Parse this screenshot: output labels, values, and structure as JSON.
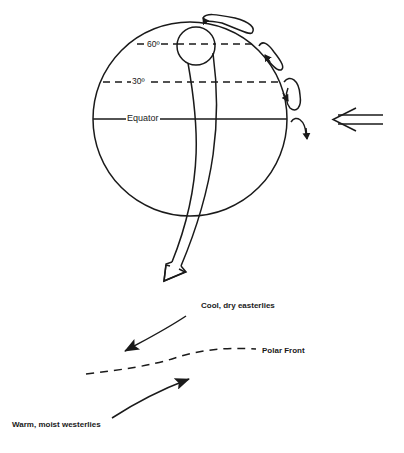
{
  "figure": {
    "globe": {
      "latitude_lines": [
        {
          "label": "60º",
          "style": "dashed"
        },
        {
          "label": "30º",
          "style": "dashed"
        },
        {
          "label": "Equator",
          "style": "solid"
        }
      ],
      "circulation_cells": [
        "polar-cell",
        "ferrel-cell",
        "hadley-cell"
      ],
      "features": [
        "polar-vortex-circle",
        "southward-flow-arrow",
        "incoming-radiation-arrow"
      ]
    },
    "front_diagram": {
      "upper_label": "Cool, dry easterlies",
      "front_label": "Polar Front",
      "lower_label": "Warm, moist westerlies"
    },
    "colors": {
      "ink": "#1a1a1a",
      "background": "#ffffff"
    }
  }
}
